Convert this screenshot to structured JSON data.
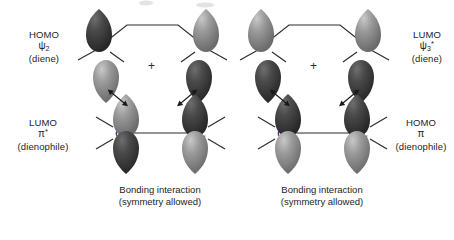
{
  "figure": {
    "background": "#ffffff",
    "lobe_dark": "#3a3a3a",
    "lobe_light": "#8d8d8d",
    "line_color": "#2b2b2b",
    "atom_label": "C",
    "plus_sign": "+"
  },
  "panels": [
    {
      "id": "left",
      "top_label": {
        "line1": "HOMO",
        "orbital": "ψ",
        "sub": "2",
        "star": "",
        "line3": "(diene)"
      },
      "bottom_label": {
        "line1": "LUMO",
        "orbital": "π",
        "sub": "",
        "star": "*",
        "line3": "(dienophile)"
      },
      "caption": {
        "line1": "Bonding interaction",
        "line2": "(symmetry allowed)"
      },
      "diene_lobes": {
        "left_top": "dark",
        "left_bottom": "light",
        "right_top": "light",
        "right_bottom": "dark"
      },
      "dienophile_lobes": {
        "left_top": "light",
        "left_bottom": "dark",
        "right_top": "dark",
        "right_bottom": "light"
      }
    },
    {
      "id": "right",
      "top_label": {
        "line1": "LUMO",
        "orbital": "ψ",
        "sub": "3",
        "star": "*",
        "line3": "(diene)"
      },
      "bottom_label": {
        "line1": "HOMO",
        "orbital": "π",
        "sub": "",
        "star": "",
        "line3": "(dienophile)"
      },
      "caption": {
        "line1": "Bonding interaction",
        "line2": "(symmetry allowed)"
      },
      "diene_lobes": {
        "left_top": "light",
        "left_bottom": "dark",
        "right_top": "light",
        "right_bottom": "dark"
      },
      "dienophile_lobes": {
        "left_top": "dark",
        "left_bottom": "light",
        "right_top": "dark",
        "right_bottom": "light"
      }
    }
  ]
}
